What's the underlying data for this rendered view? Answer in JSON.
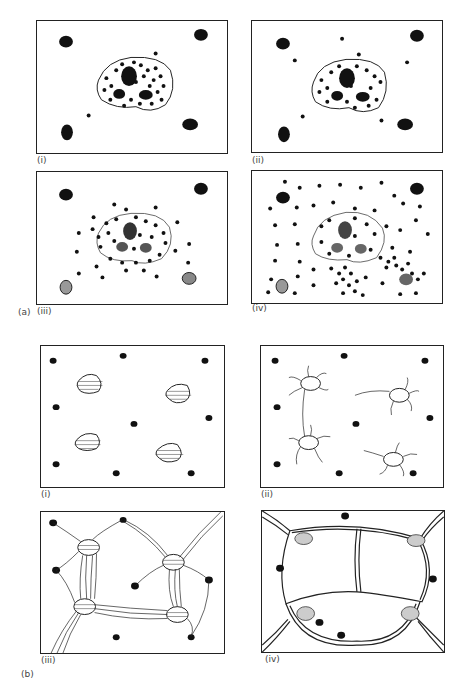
{
  "figure": {
    "part_a": {
      "label": "(a)",
      "panels": [
        {
          "label": "(i)",
          "caption": "Mast cell intact with granules, surrounding cells"
        },
        {
          "label": "(ii)",
          "caption": "Few granules released"
        },
        {
          "label": "(iii)",
          "caption": "Granules dispersing around cell"
        },
        {
          "label": "(iv)",
          "caption": "Extensive degranulation spreading"
        }
      ]
    },
    "part_b": {
      "label": "(b)",
      "panels": [
        {
          "label": "(i)",
          "caption": "Separate cells with dots"
        },
        {
          "label": "(ii)",
          "caption": "Cells extending processes"
        },
        {
          "label": "(iii)",
          "caption": "Processes connecting cells"
        },
        {
          "label": "(iv)",
          "caption": "Dense interconnected network"
        }
      ]
    }
  }
}
